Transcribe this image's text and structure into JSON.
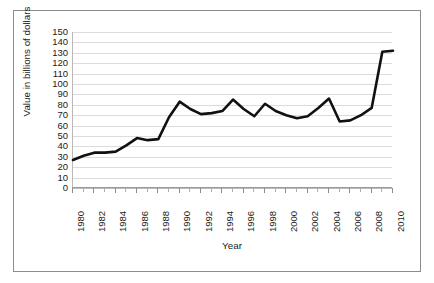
{
  "chart_data": {
    "type": "line",
    "title": "",
    "xlabel": "Year",
    "ylabel": "Value in billions of dollars",
    "xlim": [
      1980,
      2010
    ],
    "ylim": [
      0,
      150
    ],
    "ytick_step": 10,
    "xtick_step": 2,
    "grid": true,
    "legend": "none",
    "line_color": "#111111",
    "grid_color": "#dcdcdc",
    "background_color": "#ffffff",
    "frame_color": "#8c8c8c",
    "x": [
      1980,
      1981,
      1982,
      1983,
      1984,
      1985,
      1986,
      1987,
      1988,
      1989,
      1990,
      1991,
      1992,
      1993,
      1994,
      1995,
      1996,
      1997,
      1998,
      1999,
      2000,
      2001,
      2002,
      2003,
      2004,
      2005,
      2006,
      2007,
      2008,
      2009,
      2010
    ],
    "values": [
      27,
      31,
      34,
      34,
      35,
      41,
      48,
      46,
      47,
      68,
      83,
      76,
      71,
      72,
      74,
      85,
      76,
      69,
      81,
      74,
      70,
      67,
      69,
      77,
      86,
      64,
      65,
      70,
      77,
      131,
      132
    ],
    "yticks": [
      "0",
      "10",
      "20",
      "30",
      "40",
      "50",
      "60",
      "70",
      "80",
      "90",
      "100",
      "110",
      "120",
      "130",
      "140",
      "150"
    ],
    "xticklabels": [
      "1980",
      "1982",
      "1984",
      "1986",
      "1988",
      "1990",
      "1992",
      "1994",
      "1996",
      "1998",
      "2000",
      "2002",
      "2004",
      "2006",
      "2008",
      "2010"
    ]
  }
}
